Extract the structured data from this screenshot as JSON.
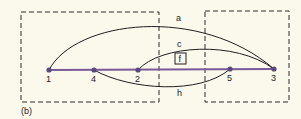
{
  "figure_label": "(b)",
  "colors": {
    "background": "#fbf8ec",
    "line": "#1f1f1f",
    "baseline": "#7a5a9a",
    "node": "#5a4a7a",
    "dash": "#2a2a2a"
  },
  "nodes": [
    {
      "id": "1",
      "label": "1",
      "x": 49,
      "y": 70
    },
    {
      "id": "4",
      "label": "4",
      "x": 94,
      "y": 70
    },
    {
      "id": "2",
      "label": "2",
      "x": 138,
      "y": 70
    },
    {
      "id": "5",
      "label": "5",
      "x": 230,
      "y": 69
    },
    {
      "id": "3",
      "label": "3",
      "x": 274,
      "y": 69
    }
  ],
  "edges": [
    {
      "id": "a",
      "label": "a",
      "from": "1",
      "to": "3"
    },
    {
      "id": "c",
      "label": "c",
      "from": "2",
      "to": "3"
    },
    {
      "id": "h",
      "label": "h",
      "from": "4",
      "to": "5"
    }
  ],
  "boxed_label": "f",
  "groups": [
    {
      "id": "left-group",
      "contains": [
        "1",
        "4",
        "2"
      ]
    },
    {
      "id": "right-group",
      "contains": [
        "5",
        "3"
      ]
    }
  ]
}
